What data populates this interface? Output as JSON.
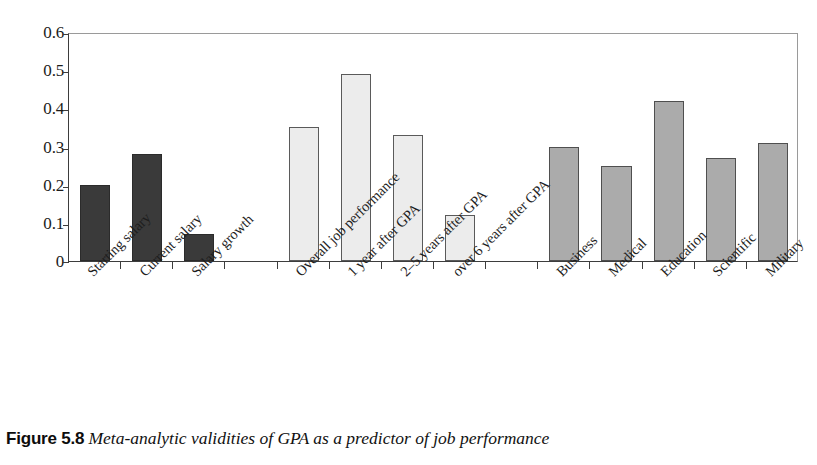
{
  "caption": {
    "figure_number": "Figure 5.8",
    "text": "Meta-analytic validities of GPA as a predictor of job performance"
  },
  "chart_data": {
    "type": "bar",
    "title": "",
    "xlabel": "",
    "ylabel": "",
    "ylim": [
      0,
      0.6
    ],
    "yticks": [
      0,
      0.1,
      0.2,
      0.3,
      0.4,
      0.5,
      0.6
    ],
    "ytick_labels": [
      "0",
      "0.1",
      "0.2",
      "0.3",
      "0.4",
      "0.5",
      "0.6"
    ],
    "grid": false,
    "legend": "none",
    "categories": [
      "Starting salary",
      "Current salary",
      "Salary growth",
      "",
      "Overall job performance",
      "1 year after GPA",
      "2–5 years after GPA",
      "over 6 years after GPA",
      "",
      "Business",
      "Medical",
      "Education",
      "Scientific",
      "Military"
    ],
    "values": [
      0.2,
      0.28,
      0.07,
      null,
      0.35,
      0.49,
      0.33,
      0.12,
      null,
      0.3,
      0.25,
      0.42,
      0.27,
      0.31
    ],
    "groups": [
      {
        "name": "Salary outcomes",
        "color": "#3a3a3a",
        "categories": [
          "Starting salary",
          "Current salary",
          "Salary growth"
        ],
        "values": [
          0.2,
          0.28,
          0.07
        ]
      },
      {
        "name": "Job performance over time",
        "color": "#ececec",
        "categories": [
          "Overall job performance",
          "1 year after GPA",
          "2–5 years after GPA",
          "over 6 years after GPA"
        ],
        "values": [
          0.35,
          0.49,
          0.33,
          0.12
        ]
      },
      {
        "name": "Occupational area",
        "color": "#ababab",
        "categories": [
          "Business",
          "Medical",
          "Education",
          "Scientific",
          "Military"
        ],
        "values": [
          0.3,
          0.25,
          0.42,
          0.27,
          0.31
        ]
      }
    ]
  }
}
